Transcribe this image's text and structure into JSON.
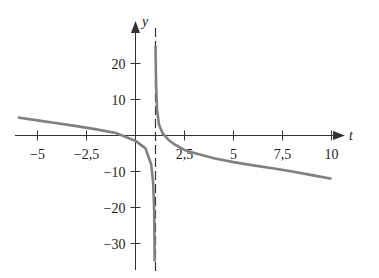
{
  "chart_data": {
    "type": "line",
    "title": "",
    "xlabel": "t",
    "ylabel": "y",
    "xlim": [
      -6.5,
      11
    ],
    "ylim": [
      -37,
      37
    ],
    "grid": false,
    "legend": null,
    "x_ticks": [
      -5,
      -2.5,
      2.5,
      5,
      7.5,
      10
    ],
    "x_tick_labels": [
      "−5",
      "−2,5",
      "2,5",
      "5",
      "7,5",
      "10"
    ],
    "y_ticks": [
      20,
      10,
      -10,
      -20,
      -30
    ],
    "y_tick_labels": [
      "20",
      "10",
      "−10",
      "−20",
      "−30"
    ],
    "annotations": [
      {
        "type": "vertical-asymptote",
        "x": 1,
        "style": "dashed"
      }
    ],
    "series": [
      {
        "name": "left-branch",
        "x": [
          -6,
          -5,
          -4,
          -3,
          -2,
          -1,
          0,
          0.5,
          0.8,
          0.9,
          0.95,
          0.98
        ],
        "y": [
          5,
          4.2,
          3.4,
          2.6,
          1.7,
          0.7,
          -1.5,
          -3.5,
          -8,
          -13,
          -20,
          -35
        ]
      },
      {
        "name": "right-branch",
        "x": [
          1.02,
          1.05,
          1.1,
          1.2,
          1.4,
          1.7,
          2,
          2.5,
          3,
          4,
          5,
          6,
          7,
          8,
          9,
          10
        ],
        "y": [
          25,
          14,
          7,
          3,
          0.5,
          -1.3,
          -2.5,
          -4,
          -4.9,
          -6.3,
          -7.4,
          -8.3,
          -9.1,
          -10,
          -11,
          -12
        ]
      }
    ]
  },
  "labels": {
    "x_axis": "t",
    "y_axis": "y"
  }
}
